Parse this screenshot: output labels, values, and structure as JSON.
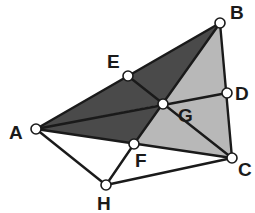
{
  "diagram": {
    "type": "geometry-figure",
    "colors": {
      "dark_fill": "#4a4a4a",
      "light_fill": "#b8b8b8",
      "background": "#ffffff",
      "stroke": "#1a1a1a"
    },
    "points": {
      "A": {
        "label": "A",
        "x": 36,
        "y": 129
      },
      "B": {
        "label": "B",
        "x": 220,
        "y": 23
      },
      "C": {
        "label": "C",
        "x": 232,
        "y": 158
      },
      "D": {
        "label": "D",
        "x": 227,
        "y": 93
      },
      "E": {
        "label": "E",
        "x": 128,
        "y": 76
      },
      "F": {
        "label": "F",
        "x": 134,
        "y": 144
      },
      "G": {
        "label": "G",
        "x": 163,
        "y": 104
      },
      "H": {
        "label": "H",
        "x": 106,
        "y": 185
      }
    },
    "labels": {
      "A": "A",
      "B": "B",
      "C": "C",
      "D": "D",
      "E": "E",
      "F": "F",
      "G": "G",
      "H": "H"
    },
    "shaded_regions": [
      {
        "vertices": [
          "A",
          "B",
          "G"
        ],
        "shade": "dark"
      },
      {
        "vertices": [
          "A",
          "G",
          "F"
        ],
        "shade": "dark"
      },
      {
        "vertices": [
          "B",
          "D",
          "G"
        ],
        "shade": "light"
      },
      {
        "vertices": [
          "G",
          "D",
          "C"
        ],
        "shade": "light"
      },
      {
        "vertices": [
          "G",
          "C",
          "F"
        ],
        "shade": "light"
      }
    ],
    "segments": [
      [
        "A",
        "B"
      ],
      [
        "B",
        "C"
      ],
      [
        "A",
        "C"
      ],
      [
        "A",
        "D"
      ],
      [
        "E",
        "C"
      ],
      [
        "B",
        "F"
      ],
      [
        "A",
        "H"
      ],
      [
        "H",
        "C"
      ],
      [
        "F",
        "H"
      ]
    ]
  }
}
